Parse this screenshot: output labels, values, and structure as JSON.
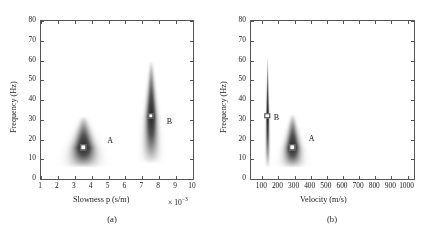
{
  "figure": {
    "background_color": "#ffffff",
    "axis_color": "#555555",
    "blob_color": "#4a4a4a",
    "marker_face_color": "#ffffff",
    "marker_edge_color": "#3a3a3a"
  },
  "panels": [
    {
      "caption": "(a)",
      "xlabel": "Slowness p (s/m)",
      "ylabel": "Frequency (Hz)",
      "exponent_prefix": "× 10",
      "exponent_value": "−3",
      "xticks": [
        "1",
        "2",
        "3",
        "4",
        "5",
        "6",
        "7",
        "8",
        "9",
        "10"
      ],
      "yticks": [
        "0",
        "10",
        "20",
        "30",
        "40",
        "50",
        "60",
        "70",
        "80"
      ],
      "modes": [
        {
          "label": "A",
          "pick_x": 3.5,
          "pick_y": 16,
          "label_x": 5.1,
          "label_y": 19.5
        },
        {
          "label": "B",
          "pick_x": 7.5,
          "pick_y": 32,
          "label_x": 8.6,
          "label_y": 29.5
        }
      ]
    },
    {
      "caption": "(b)",
      "xlabel": "Velocity (m/s)",
      "ylabel": "Frequency (Hz)",
      "exponent_prefix": "",
      "exponent_value": "",
      "xticks": [
        "100",
        "200",
        "300",
        "400",
        "500",
        "600",
        "700",
        "800",
        "900",
        "1000"
      ],
      "yticks": [
        "0",
        "10",
        "20",
        "30",
        "40",
        "50",
        "60",
        "70",
        "80"
      ],
      "modes": [
        {
          "label": "B",
          "pick_x": 130,
          "pick_y": 32,
          "label_x": 188,
          "label_y": 31.5
        },
        {
          "label": "A",
          "pick_x": 285,
          "pick_y": 16,
          "label_x": 405,
          "label_y": 21
        }
      ]
    }
  ],
  "chart_data": {
    "type": "heatmap",
    "title": "",
    "subtitle": "",
    "panels": [
      {
        "name": "(a)",
        "xlabel": "Slowness p (s/m)",
        "ylabel": "Frequency (Hz)",
        "x_scale_exponent": -3,
        "xlim": [
          1,
          10
        ],
        "ylim": [
          0,
          80
        ],
        "xtick_values": [
          1,
          2,
          3,
          4,
          5,
          6,
          7,
          8,
          9,
          10
        ],
        "ytick_values": [
          0,
          10,
          20,
          30,
          40,
          50,
          60,
          70,
          80
        ],
        "grid": false,
        "legend": "none",
        "colormap": "grayscale (white = low energy, dark = high energy)",
        "energy_lobes": [
          {
            "mode": "A",
            "peak_slowness": 3.5,
            "peak_frequency": 16,
            "frequency_extent": [
              6,
              32
            ],
            "slowness_extent": [
              2.3,
              4.8
            ],
            "shape": "broad teardrop, widening downward",
            "pick_marker": {
              "x": 3.5,
              "y": 16
            }
          },
          {
            "mode": "B",
            "peak_slowness": 7.5,
            "peak_frequency": 32,
            "frequency_extent": [
              8,
              60
            ],
            "slowness_extent": [
              6.9,
              8.3
            ],
            "shape": "narrow tall teardrop, widening downward",
            "pick_marker": {
              "x": 7.5,
              "y": 32
            }
          }
        ],
        "annotations": [
          {
            "text": "A",
            "x": 5.1,
            "y": 19.5
          },
          {
            "text": "B",
            "x": 8.6,
            "y": 29.5
          }
        ]
      },
      {
        "name": "(b)",
        "xlabel": "Velocity (m/s)",
        "ylabel": "Frequency (Hz)",
        "x_scale_exponent": 0,
        "xlim": [
          30,
          1040
        ],
        "ylim": [
          0,
          80
        ],
        "xtick_values": [
          100,
          200,
          300,
          400,
          500,
          600,
          700,
          800,
          900,
          1000
        ],
        "ytick_values": [
          0,
          10,
          20,
          30,
          40,
          50,
          60,
          70,
          80
        ],
        "grid": false,
        "legend": "none",
        "colormap": "grayscale (white = low energy, dark = high energy)",
        "energy_lobes": [
          {
            "mode": "B",
            "peak_velocity": 130,
            "peak_frequency": 32,
            "frequency_extent": [
              6,
              62
            ],
            "velocity_extent": [
              110,
              150
            ],
            "shape": "very thin vertical streak",
            "pick_marker": {
              "x": 130,
              "y": 32
            }
          },
          {
            "mode": "A",
            "peak_velocity": 285,
            "peak_frequency": 16,
            "frequency_extent": [
              6,
              33
            ],
            "velocity_extent": [
              210,
              390
            ],
            "shape": "broad teardrop, widening downward",
            "pick_marker": {
              "x": 285,
              "y": 16
            }
          }
        ],
        "annotations": [
          {
            "text": "B",
            "x": 188,
            "y": 31.5
          },
          {
            "text": "A",
            "x": 405,
            "y": 21
          }
        ]
      }
    ]
  }
}
